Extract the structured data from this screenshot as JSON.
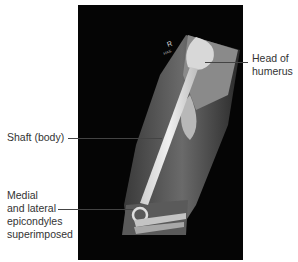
{
  "figure": {
    "type": "radiograph",
    "marker": "R",
    "labels": {
      "head": [
        "Head of",
        "humerus"
      ],
      "shaft": [
        "Shaft (body)"
      ],
      "epicondyles": [
        "Medial",
        "and lateral",
        "epicondyles",
        "superimposed"
      ]
    }
  },
  "colors": {
    "background": "#ffffff",
    "film": "#050505",
    "label_text": "#333333",
    "leader_line": "#444444"
  }
}
